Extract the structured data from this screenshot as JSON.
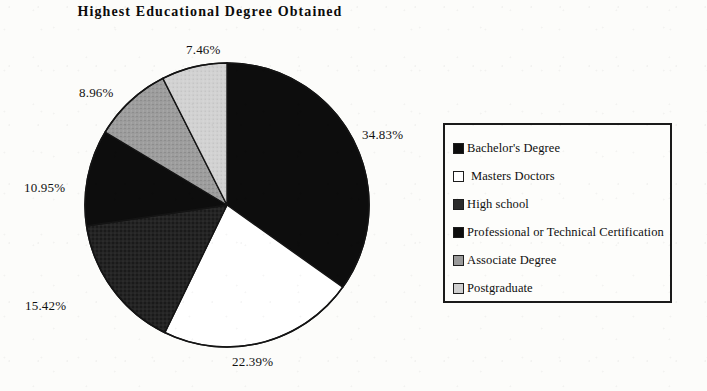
{
  "chart_data": {
    "type": "pie",
    "title": "Highest Educational Degree Obtained",
    "categories": [
      "Bachelor's Degree",
      "Masters    Doctors",
      "High school",
      "Professional or Technical Certification",
      "Associate Degree",
      "Postgraduate"
    ],
    "values": [
      34.83,
      22.39,
      15.42,
      10.95,
      8.96,
      7.46
    ],
    "data_labels": [
      "34.83%",
      "22.39%",
      "15.42%",
      "10.95%",
      "8.96%",
      "7.46%"
    ],
    "units": "percent",
    "start_angle_deg": 0,
    "direction": "clockwise",
    "legend_position": "right",
    "grid": false,
    "xlabel": "",
    "ylabel": "",
    "slice_colors": [
      "#0d0d0d",
      "#ffffff",
      "#2b2b2b",
      "#0d0d0d",
      "#9a9a9a",
      "#cfcfcf"
    ],
    "slice_order_note": "clockwise from 12 o'clock"
  },
  "legend": {
    "items": [
      {
        "label": "Bachelor's Degree",
        "color": "#0d0d0d",
        "sparse": false
      },
      {
        "label": "Masters    Doctors",
        "color": "#ffffff",
        "sparse": true
      },
      {
        "label": "High school",
        "color": "#2b2b2b",
        "sparse": false
      },
      {
        "label": "Professional or Technical Certification",
        "color": "#0d0d0d",
        "sparse": false
      },
      {
        "label": "Associate Degree",
        "color": "#9a9a9a",
        "sparse": false
      },
      {
        "label": "Postgraduate",
        "color": "#cfcfcf",
        "sparse": false
      }
    ]
  },
  "colors": {
    "background": "#fcfcfa",
    "ink": "#111111",
    "outline": "#1a1a1a"
  }
}
